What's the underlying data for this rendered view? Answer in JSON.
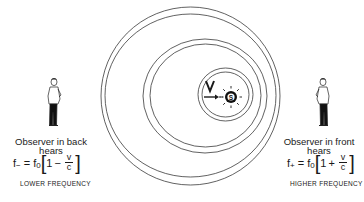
{
  "diagram": {
    "topic": "Doppler effect",
    "source": {
      "label": "S",
      "velocity_label": "V"
    },
    "left_observer": {
      "caption_line1": "Observer in back",
      "caption_line2": "hears",
      "formula": {
        "lhs": "f",
        "lhs_sub": "−",
        "equals": "=",
        "f0": "f",
        "f0_sub": "0",
        "one": "1",
        "op": "−",
        "num": "v",
        "den": "c"
      },
      "result": "LOWER FREQUENCY"
    },
    "right_observer": {
      "caption_line1": "Observer in front",
      "caption_line2": "hears",
      "formula": {
        "lhs": "f",
        "lhs_sub": "+",
        "equals": "=",
        "f0": "f",
        "f0_sub": "0",
        "one": "1",
        "op": "+",
        "num": "v",
        "den": "c"
      },
      "result": "HIGHER FREQUENCY"
    },
    "colors": {
      "line": "#3a3a3a",
      "ink": "#1a1a1a",
      "background": "#ffffff"
    }
  }
}
